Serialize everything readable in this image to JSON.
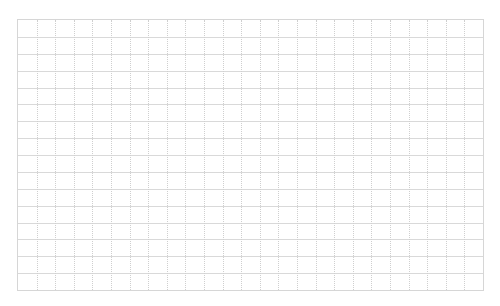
{
  "page": {
    "title": "",
    "background_color": "#ffffff"
  },
  "grid": {
    "columns": 25,
    "rows": 16,
    "horizontal_line_style": "solid",
    "vertical_line_style": "dotted",
    "line_color": "#d9d9d9",
    "border_color": "#d6d6d6"
  }
}
